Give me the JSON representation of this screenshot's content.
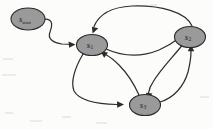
{
  "diagram": {
    "type": "state-transition-diagram",
    "background_color": "#fcfcfb",
    "node_fill_color": "#9a9a9a",
    "node_stroke_color": "#2b2b2b",
    "edge_color": "#2f2f2f",
    "label_color": "#1a1a1a",
    "nodes": [
      {
        "id": "s_start",
        "label_base": "s",
        "label_sub": "start",
        "cx": 28,
        "cy": 19,
        "rx": 17,
        "ry": 11
      },
      {
        "id": "s1",
        "label_base": "s",
        "label_sub": "1",
        "cx": 92,
        "cy": 45,
        "rx": 15.5,
        "ry": 10.5
      },
      {
        "id": "s2",
        "label_base": "s",
        "label_sub": "2",
        "cx": 190,
        "cy": 37,
        "rx": 15.5,
        "ry": 10.5
      },
      {
        "id": "s3",
        "label_base": "s",
        "label_sub": "3",
        "cx": 145,
        "cy": 105,
        "rx": 15.5,
        "ry": 10.5
      }
    ],
    "edges": [
      {
        "id": "e-start-s1",
        "from": "s_start",
        "to": "s1",
        "style": "s-curve"
      },
      {
        "id": "e-s2-s1",
        "from": "s2",
        "to": "s1",
        "style": "top-arc"
      },
      {
        "id": "e-s1-s2",
        "from": "s1",
        "to": "s2",
        "style": "middle-curve"
      },
      {
        "id": "e-s1-s3",
        "from": "s1",
        "to": "s3",
        "style": "left-sweep"
      },
      {
        "id": "e-s2-s3",
        "from": "s2",
        "to": "s3",
        "style": "right-down"
      },
      {
        "id": "e-s3-s1",
        "from": "s3",
        "to": "s1",
        "style": "up-left"
      },
      {
        "id": "e-s3-s2",
        "from": "s3",
        "to": "s2",
        "style": "right-up"
      }
    ]
  }
}
